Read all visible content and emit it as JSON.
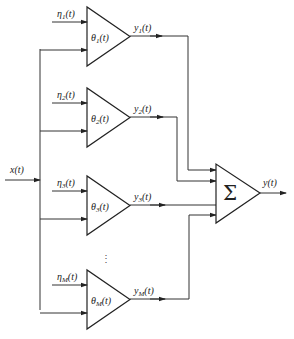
{
  "diagram": {
    "input_label": "x(t)",
    "output_label": "y(t)",
    "sum_symbol": "Σ",
    "ellipsis": "⋮",
    "branches": [
      {
        "noise": "η",
        "noise_sub": "1",
        "param": "θ",
        "param_sub": "1",
        "out": "y",
        "out_sub": "1",
        "arg": "(t)"
      },
      {
        "noise": "η",
        "noise_sub": "2",
        "param": "θ",
        "param_sub": "2",
        "out": "y",
        "out_sub": "2",
        "arg": "(t)"
      },
      {
        "noise": "η",
        "noise_sub": "3",
        "param": "θ",
        "param_sub": "3",
        "out": "y",
        "out_sub": "3",
        "arg": "(t)"
      },
      {
        "noise": "η",
        "noise_sub": "M",
        "param": "θ",
        "param_sub": "M",
        "out": "y",
        "out_sub": "M",
        "arg": "(t)"
      }
    ]
  }
}
